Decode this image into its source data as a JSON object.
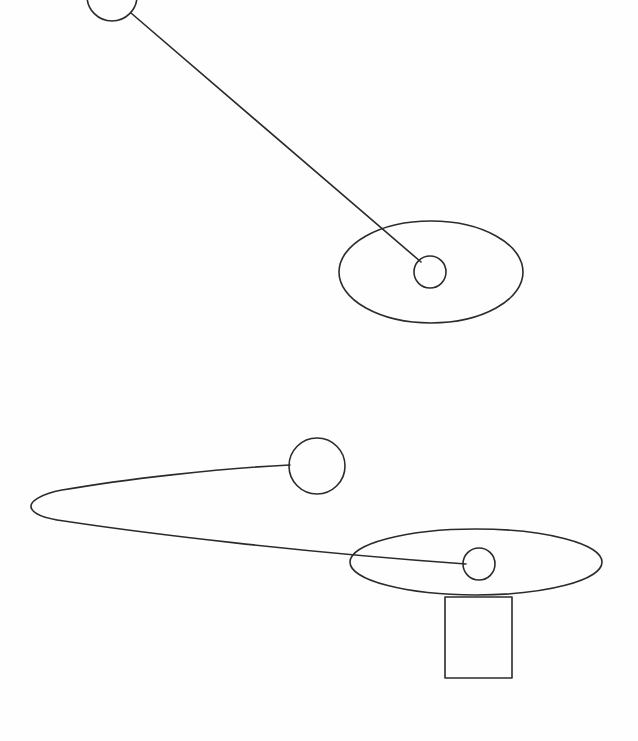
{
  "canvas": {
    "width": 638,
    "height": 741,
    "background_color": "#fefefe",
    "stroke_color": "#2b2b2b",
    "stroke_width": 1.6,
    "fill": "none",
    "title": "Line drawing of two abstract ball-and-disc figures"
  },
  "figures": [
    {
      "id": "upper-figure",
      "name": "upper-ball-and-disc",
      "parts": [
        {
          "name": "upper-small-ball",
          "type": "circle",
          "cx": 112,
          "cy": -4,
          "r": 25,
          "note": "clipped by top edge of canvas"
        },
        {
          "name": "upper-connector-rod",
          "type": "line",
          "x1": 131,
          "y1": 13,
          "x2": 421,
          "y2": 262
        },
        {
          "name": "upper-large-disc",
          "type": "ellipse",
          "cx": 431,
          "cy": 272,
          "rx": 92,
          "ry": 51
        },
        {
          "name": "upper-hub-circle",
          "type": "circle",
          "cx": 430,
          "cy": 272,
          "r": 16
        }
      ]
    },
    {
      "id": "lower-figure",
      "name": "lower-ball-and-disc-with-stem",
      "parts": [
        {
          "name": "lower-small-ball",
          "type": "circle",
          "cx": 317,
          "cy": 466,
          "r": 28
        },
        {
          "name": "lower-hook-curve",
          "type": "path",
          "d": "M 290 465 C 220 468 120 480 62 490 C 40 494 30 502 31 507 C 32 513 42 518 64 521 C 150 534 300 552 466 564",
          "note": "long looping arm from ball around left tip to hub"
        },
        {
          "name": "lower-large-disc",
          "type": "ellipse",
          "cx": 476,
          "cy": 562,
          "rx": 126,
          "ry": 33
        },
        {
          "name": "lower-hub-circle",
          "type": "ellipse",
          "cx": 479,
          "cy": 564,
          "rx": 16,
          "ry": 16
        },
        {
          "name": "lower-stem-rectangle",
          "type": "rect",
          "x": 445,
          "y": 597,
          "width": 67,
          "height": 81
        }
      ]
    }
  ]
}
